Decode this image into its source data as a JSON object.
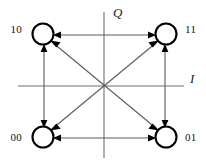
{
  "figure": {
    "background_color": "#ffffff"
  },
  "axes": {
    "vertical": {
      "label": "Q",
      "label_x": 113,
      "label_y": 17,
      "x": 104,
      "y1": 12,
      "y2": 158,
      "color": "#6e6e6e"
    },
    "horizontal": {
      "label": "I",
      "label_x": 190,
      "label_y": 83,
      "y": 86,
      "x1": 18,
      "x2": 184,
      "color": "#6e6e6e"
    },
    "origin": {
      "x": 104,
      "y": 86
    }
  },
  "nodes": [
    {
      "id": "node-10",
      "label": "10",
      "cx": 43,
      "cy": 34,
      "r": 10.5,
      "label_x": 22,
      "label_y": 33,
      "label_anchor": "end",
      "stroke_color": "#000000"
    },
    {
      "id": "node-11",
      "label": "11",
      "cx": 166,
      "cy": 34,
      "r": 10.5,
      "label_x": 185,
      "label_y": 33,
      "label_anchor": "start",
      "stroke_color": "#000000"
    },
    {
      "id": "node-00",
      "label": "00",
      "cx": 43,
      "cy": 137,
      "r": 10.5,
      "label_x": 22,
      "label_y": 141,
      "label_anchor": "end",
      "stroke_color": "#000000"
    },
    {
      "id": "node-01",
      "label": "01",
      "cx": 166,
      "cy": 137,
      "r": 10.5,
      "label_x": 185,
      "label_y": 141,
      "label_anchor": "start",
      "stroke_color": "#000000"
    }
  ],
  "transitions": [
    {
      "id": "edge-10-11",
      "from": "10",
      "to": "11",
      "kind": "horizontal-top",
      "bidirectional": true
    },
    {
      "id": "edge-00-01",
      "from": "00",
      "to": "01",
      "kind": "horizontal-bottom",
      "bidirectional": true
    },
    {
      "id": "edge-10-00",
      "from": "10",
      "to": "00",
      "kind": "vertical-left",
      "bidirectional": true
    },
    {
      "id": "edge-11-01",
      "from": "11",
      "to": "01",
      "kind": "vertical-right",
      "bidirectional": true
    },
    {
      "id": "edge-10-01",
      "from": "10",
      "to": "01",
      "kind": "diagonal-down-right",
      "bidirectional": true
    },
    {
      "id": "edge-11-00",
      "from": "11",
      "to": "00",
      "kind": "diagonal-down-left",
      "bidirectional": true
    }
  ],
  "style": {
    "edge_color": "#5a5a5a",
    "node_stroke_color": "#000000",
    "arrow_color": "#000000",
    "label_color": "#111111"
  }
}
